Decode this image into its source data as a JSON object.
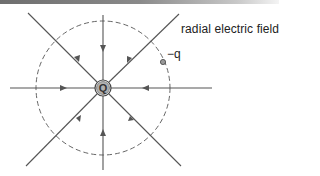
{
  "diagram": {
    "title": "radial electric field",
    "center_charge_label": "Q",
    "test_charge_label": "−q",
    "field_lines": [
      {
        "direction": "top",
        "arrow": "inward"
      },
      {
        "direction": "top-right",
        "arrow": "inward"
      },
      {
        "direction": "right",
        "arrow": "inward"
      },
      {
        "direction": "bottom-right",
        "arrow": "inward"
      },
      {
        "direction": "bottom",
        "arrow": "inward"
      },
      {
        "direction": "bottom-left",
        "arrow": "inward"
      },
      {
        "direction": "left",
        "arrow": "inward"
      },
      {
        "direction": "top-left",
        "arrow": "inward"
      }
    ],
    "equipotential": "dashed-circle",
    "colors": {
      "lines": "#555555",
      "charge_fill": "#b0b0b0",
      "header_bar": "#7a7a7a"
    }
  }
}
